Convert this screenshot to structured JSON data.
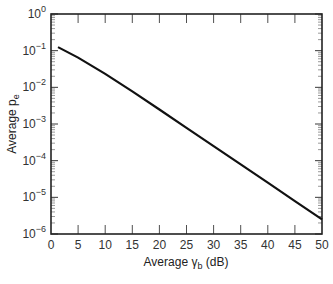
{
  "chart_data": {
    "type": "line",
    "title": "",
    "xlabel": "Average γb (dB)",
    "xlabel_parts": {
      "prefix": "Average ",
      "symbol": "γ",
      "subscript": "b",
      "suffix": " (dB)"
    },
    "ylabel": "Average pe",
    "ylabel_parts": {
      "prefix": "Average p",
      "subscript": "e"
    },
    "xlim": [
      0,
      50
    ],
    "ylim": [
      1e-06,
      1
    ],
    "yscale": "log",
    "grid": false,
    "legend": null,
    "x_ticks": [
      0,
      5,
      10,
      15,
      20,
      25,
      30,
      35,
      40,
      45,
      50
    ],
    "x_tick_labels": [
      "0",
      "5",
      "10",
      "15",
      "20",
      "25",
      "30",
      "35",
      "40",
      "45",
      "50"
    ],
    "y_tick_exponents": [
      0,
      -1,
      -2,
      -3,
      -4,
      -5,
      -6
    ],
    "y_tick_labels": [
      "10^0",
      "10^-1",
      "10^-2",
      "10^-3",
      "10^-4",
      "10^-5",
      "10^-6"
    ],
    "series": [
      {
        "name": "Average pe",
        "color": "#111111",
        "x": [
          1.3,
          5,
          10,
          15,
          20,
          25,
          30,
          35,
          40,
          45,
          50
        ],
        "y": [
          0.125,
          0.0648,
          0.0233,
          0.00775,
          0.00248,
          0.000788,
          0.00025,
          7.9e-05,
          2.5e-05,
          7.9e-06,
          2.5e-06
        ]
      }
    ]
  },
  "colors": {
    "line": "#111111",
    "axis": "#222222",
    "background": "#ffffff"
  }
}
